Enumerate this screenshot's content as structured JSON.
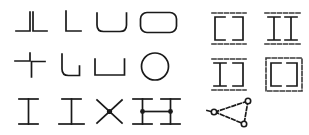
{
  "figure": {
    "title": "",
    "background_color": "#ffffff",
    "stroke_color": "#1a1a1a",
    "dash_color": "#3a3a3a",
    "panels": [
      {
        "id": "left-panel",
        "name": "profile-shapes-grid",
        "rows": 3,
        "cols": 4,
        "cells": [
          {
            "row": 1,
            "col": 1,
            "name": "double-corner-angle-profile",
            "label": "double corner angle"
          },
          {
            "row": 1,
            "col": 2,
            "name": "L-angle-profile",
            "label": "L angle"
          },
          {
            "row": 1,
            "col": 3,
            "name": "rounded-channel-profile",
            "label": "rounded channel"
          },
          {
            "row": 1,
            "col": 4,
            "name": "rounded-rectangle-tube-profile",
            "label": "rounded rectangular tube"
          },
          {
            "row": 2,
            "col": 1,
            "name": "offset-corner-pair-profile",
            "label": "offset corner pair"
          },
          {
            "row": 2,
            "col": 2,
            "name": "rounded-corner-channel-profile",
            "label": "rounded corner channel"
          },
          {
            "row": 2,
            "col": 3,
            "name": "trapezoid-channel-profile",
            "label": "trapezoid channel"
          },
          {
            "row": 2,
            "col": 4,
            "name": "circle-tube-profile",
            "label": "circular tube"
          },
          {
            "row": 3,
            "col": 1,
            "name": "I-beam-narrow-profile",
            "label": "narrow I beam"
          },
          {
            "row": 3,
            "col": 2,
            "name": "I-beam-wide-profile",
            "label": "wide I beam"
          },
          {
            "row": 3,
            "col": 3,
            "name": "X-cross-node-profile",
            "label": "X cross with node"
          },
          {
            "row": 3,
            "col": 4,
            "name": "H-beam-node-profile",
            "label": "H beam with nodes"
          }
        ]
      },
      {
        "id": "right-panel",
        "name": "assembly-diagram-grid",
        "rows": 3,
        "cols": 2,
        "cells": [
          {
            "row": 1,
            "col": 1,
            "name": "bracket-pair-dashed-assembly",
            "label": "bracket pair with dashed plates"
          },
          {
            "row": 1,
            "col": 2,
            "name": "double-I-dashed-assembly",
            "label": "double I with dashed plates"
          },
          {
            "row": 2,
            "col": 1,
            "name": "I-and-bracket-dashed-assembly",
            "label": "I and bracket with dashed plates"
          },
          {
            "row": 2,
            "col": 2,
            "name": "dashed-frame-bracket-assembly",
            "label": "dashed frame bracket"
          },
          {
            "row": 3,
            "col": 1,
            "name": "triangular-node-truss",
            "label": "triangular node truss"
          }
        ]
      }
    ]
  }
}
